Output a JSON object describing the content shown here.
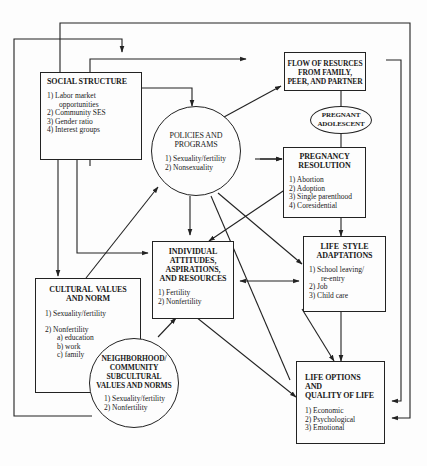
{
  "diagram": {
    "nodes": {
      "social_structure": {
        "title": "SOCIAL STRUCTURE",
        "items": [
          "1) Labor market",
          "opportunities",
          "2) Community SES",
          "3) Gender ratio",
          "4) Interest groups"
        ]
      },
      "policies": {
        "title_1": "POLICIES AND",
        "title_2": "PROGRAMS",
        "items": [
          "1) Sexuality/fertility",
          "2) Nonsexuality"
        ]
      },
      "flow_resources": {
        "title_1": "FLOW OF RESURCES",
        "title_2": "FROM FAMILY,",
        "title_3": "PEER, AND PARTNER"
      },
      "pregnant_adolescent": {
        "title_1": "PREGNANT",
        "title_2": "ADOLESCENT"
      },
      "pregnancy_resolution": {
        "title_1": "PREGNANCY",
        "title_2": "RESOLUTION",
        "items": [
          "1) Abortion",
          "2) Adoption",
          "3) Single parenthood",
          "4) Coresidential"
        ]
      },
      "individual": {
        "title_1": "INDIVIDUAL",
        "title_2": "ATTITUDES,",
        "title_3": "ASPIRATIONS,",
        "title_4": "AND RESOURCES",
        "items": [
          "1) Fertility",
          "2) Nonfertility"
        ]
      },
      "life_style": {
        "title_1": "LIFE  STYLE",
        "title_2": "ADAPTATIONS",
        "items": [
          "1) School leaving/",
          "re-entry",
          "2) Job",
          "3) Child care"
        ]
      },
      "cultural_values": {
        "title_1": "CULTURAL  VALUES",
        "title_2": "AND NORM",
        "items": [
          "1) Sexuality/fertility",
          "2) Nonfertility",
          "a) education",
          "b) work",
          "c) family"
        ]
      },
      "neighborhood": {
        "title_1": "NEIGHBORHOOD/",
        "title_2": "COMMUNITY",
        "title_3": "SUBCULTURAL",
        "title_4": "VALUES AND NORMS",
        "items": [
          "1) Sexuality/fertility",
          "2) Nonfertility"
        ]
      },
      "life_options": {
        "title_1": "LIFE OPTIONS AND",
        "title_2": "QUALITY OF LIFE",
        "items": [
          "1) Economic",
          "2) Psychological",
          "3) Emotional"
        ]
      }
    },
    "colors": {
      "line": "#222222",
      "background": "#fdfdfd"
    }
  }
}
